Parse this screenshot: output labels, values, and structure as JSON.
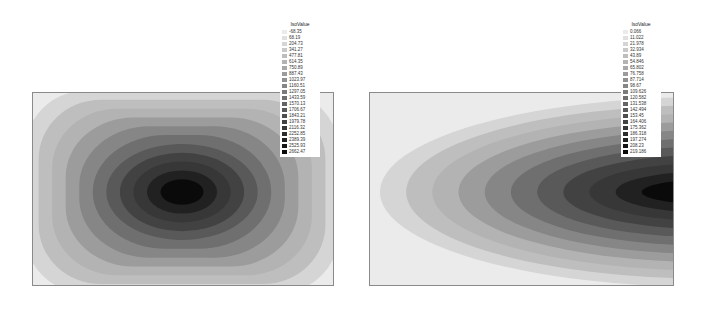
{
  "chart_data": [
    {
      "type": "heatmap",
      "subtype": "filled-contour",
      "title": "",
      "legend_title": "IsoValue",
      "legend_position": "top-right",
      "colormap": "grayscale (light = low, dark = high)",
      "pattern": "elliptical concentric contours, maximum at center",
      "levels": [
        -68.35,
        68.19,
        204.73,
        341.27,
        477.81,
        614.35,
        750.89,
        887.43,
        1023.97,
        1160.51,
        1297.05,
        1433.59,
        1570.13,
        1706.67,
        1843.21,
        1979.78,
        2116.32,
        2252.85,
        2389.39,
        2525.93,
        2662.47
      ],
      "grid": false
    },
    {
      "type": "heatmap",
      "subtype": "filled-contour",
      "title": "",
      "legend_title": "IsoValue",
      "legend_position": "top-right",
      "colormap": "grayscale (light = low, dark = high)",
      "pattern": "nested U-shaped contours opening left, maximum at right-center edge",
      "levels": [
        0.07,
        11.02,
        21.98,
        32.94,
        43.89,
        54.85,
        65.81,
        76.76,
        87.72,
        98.67,
        109.63,
        120.58,
        131.54,
        142.49,
        153.45,
        164.41,
        175.36,
        186.32,
        197.27,
        208.23,
        219.19
      ],
      "grid": false
    }
  ],
  "legends": {
    "left": {
      "title": "IsoValue",
      "labels": [
        "-68.35",
        "68.19",
        "204.73",
        "341.27",
        "477.81",
        "614.35",
        "750.89",
        "887.43",
        "1023.97",
        "1160.51",
        "1297.05",
        "1433.59",
        "1570.13",
        "1706.67",
        "1843.21",
        "1979.78",
        "2116.32",
        "2252.85",
        "2389.39",
        "2525.93",
        "2662.47"
      ]
    },
    "right": {
      "title": "IsoValue",
      "labels": [
        "0.066",
        "11.022",
        "21.978",
        "32.934",
        "43.89",
        "54.846",
        "65.802",
        "76.758",
        "87.714",
        "98.67",
        "109.626",
        "120.582",
        "131.538",
        "142.494",
        "153.45",
        "164.406",
        "175.362",
        "186.318",
        "197.274",
        "208.23",
        "219.186"
      ]
    }
  }
}
